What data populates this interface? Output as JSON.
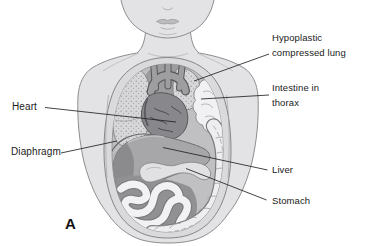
{
  "figure": {
    "panel_letter": "A",
    "labels": {
      "hypoplastic_lung": "Hypoplastic compressed lung",
      "intestine_in_thorax": "Intestine in thorax",
      "heart": "Heart",
      "diaphragm": "Diaphragm",
      "liver": "Liver",
      "stomach": "Stomach"
    },
    "colors": {
      "background": "#ffffff",
      "skin": "#e3e3e5",
      "body_outline": "#8e8e90",
      "cavity": "#c0c0c2",
      "rim": "#dadadc",
      "lung": "#d7d7d9",
      "lung_stipple": "#97979a",
      "heart": "#88888c",
      "vessel": "#58585c",
      "liver": "#a7a7a9",
      "liver_dark": "#8b8b8d",
      "stomach": "#e1e1e3",
      "bowel": "#f2f2f4",
      "bowel_outline": "#7a7a7e",
      "leader_line": "#222222",
      "label_text": "#1a1a1a"
    }
  }
}
